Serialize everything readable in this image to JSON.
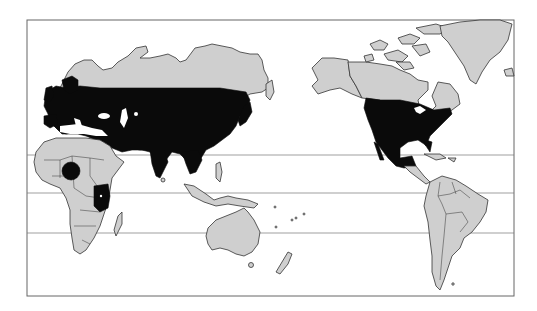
{
  "map": {
    "title": "",
    "projection": "Pacific-centered world map",
    "colors": {
      "background": "#ffffff",
      "land": "#cfcfcf",
      "distribution": "#0a0a0a",
      "frame": "#666666",
      "reference_lines": "#777777"
    },
    "reference_lines": [
      {
        "name": "line-1",
        "y": 155
      },
      {
        "name": "line-2",
        "y": 193
      },
      {
        "name": "line-3",
        "y": 233
      }
    ],
    "distribution_regions": [
      "Europe",
      "Northern Africa coast",
      "Central and southern Asia",
      "Japan",
      "West Africa spot",
      "East Africa patch",
      "United States",
      "Mexico"
    ],
    "unshaded_land": [
      "Northern Russia / Siberia",
      "Scandinavia",
      "Alaska",
      "Canada",
      "Greenland",
      "Arctic islands",
      "Sub-Saharan Africa",
      "Madagascar",
      "Southeast Asia islands",
      "Australia",
      "New Zealand",
      "Central America",
      "Caribbean",
      "South America"
    ]
  }
}
